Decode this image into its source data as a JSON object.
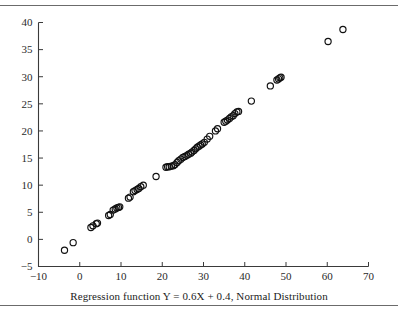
{
  "figure": {
    "background_color": "#ffffff",
    "rule_color": "#6b6b6b",
    "has_top_rule": true,
    "has_bottom_rule": true
  },
  "axes": {
    "frame_style": "open-left-bottom",
    "axis_color": "#3a3a3a",
    "tick_direction": "in",
    "grid": false
  },
  "chart_data": {
    "type": "scatter",
    "title": "",
    "xlabel": "Regression function Y = 0.6X + 0.4, Normal Distribution",
    "ylabel": "",
    "xlim": [
      -10,
      70
    ],
    "ylim": [
      -5,
      40
    ],
    "xticks": [
      -10,
      0,
      10,
      20,
      30,
      40,
      50,
      60,
      70
    ],
    "xtick_labels": [
      "−10",
      "0",
      "10",
      "20",
      "30",
      "40",
      "50",
      "60",
      "70"
    ],
    "yticks": [
      -5,
      0,
      5,
      10,
      15,
      20,
      25,
      30,
      35,
      40
    ],
    "ytick_labels": [
      "−5",
      "0",
      "5",
      "10",
      "15",
      "20",
      "25",
      "30",
      "35",
      "40"
    ],
    "grid": false,
    "legend": null,
    "marker": {
      "shape": "circle-open",
      "radius_px": 3.1,
      "edge_color": "#111111",
      "face_color": "none",
      "line_width": 1.15
    },
    "regression_line_shown": false,
    "regression_formula": "Y = 0.6X + 0.4",
    "distribution": "Normal Distribution",
    "point_count": 72,
    "series": [
      {
        "name": "observations",
        "points": [
          [
            -3.7,
            -2.0
          ],
          [
            -1.6,
            -0.6
          ],
          [
            2.7,
            2.2
          ],
          [
            3.2,
            2.5
          ],
          [
            4.0,
            2.9
          ],
          [
            4.3,
            3.0
          ],
          [
            7.0,
            4.4
          ],
          [
            7.4,
            4.6
          ],
          [
            8.1,
            5.4
          ],
          [
            8.6,
            5.6
          ],
          [
            9.0,
            5.8
          ],
          [
            9.4,
            5.9
          ],
          [
            9.7,
            6.0
          ],
          [
            11.8,
            7.6
          ],
          [
            12.2,
            7.8
          ],
          [
            13.0,
            8.8
          ],
          [
            13.4,
            9.0
          ],
          [
            13.9,
            9.2
          ],
          [
            14.3,
            9.4
          ],
          [
            14.8,
            9.7
          ],
          [
            15.4,
            10.0
          ],
          [
            18.5,
            11.6
          ],
          [
            20.9,
            13.3
          ],
          [
            21.3,
            13.4
          ],
          [
            21.7,
            13.4
          ],
          [
            22.2,
            13.5
          ],
          [
            22.7,
            13.6
          ],
          [
            23.1,
            13.8
          ],
          [
            23.6,
            14.2
          ],
          [
            24.0,
            14.5
          ],
          [
            24.5,
            14.8
          ],
          [
            25.0,
            15.1
          ],
          [
            25.5,
            15.3
          ],
          [
            26.0,
            15.5
          ],
          [
            26.4,
            15.7
          ],
          [
            26.9,
            15.9
          ],
          [
            27.2,
            16.1
          ],
          [
            27.7,
            16.4
          ],
          [
            28.1,
            16.7
          ],
          [
            28.5,
            17.0
          ],
          [
            28.9,
            17.2
          ],
          [
            29.3,
            17.4
          ],
          [
            29.7,
            17.6
          ],
          [
            30.2,
            17.9
          ],
          [
            30.9,
            18.5
          ],
          [
            31.5,
            19.0
          ],
          [
            32.9,
            20.0
          ],
          [
            33.4,
            20.4
          ],
          [
            35.0,
            21.6
          ],
          [
            35.4,
            21.8
          ],
          [
            35.8,
            22.0
          ],
          [
            36.3,
            22.3
          ],
          [
            36.7,
            22.6
          ],
          [
            37.2,
            22.8
          ],
          [
            37.6,
            23.2
          ],
          [
            38.1,
            23.5
          ],
          [
            38.5,
            23.6
          ],
          [
            41.6,
            25.5
          ],
          [
            46.2,
            28.3
          ],
          [
            47.8,
            29.4
          ],
          [
            48.2,
            29.6
          ],
          [
            48.5,
            29.8
          ],
          [
            48.8,
            29.9
          ],
          [
            60.2,
            36.5
          ],
          [
            63.8,
            38.7
          ]
        ]
      }
    ]
  }
}
